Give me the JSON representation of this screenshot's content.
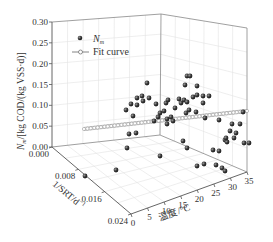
{
  "chart_data": {
    "type": "scatter3d",
    "title": "",
    "zlabel": "N_m/[kg COD/(kg VSS·d)]",
    "xlabel": "1/SRT/d⁻¹",
    "ylabel": "温度/°C",
    "zlim": [
      0,
      0.3
    ],
    "xlim": [
      0,
      0.024
    ],
    "ylim": [
      0,
      35
    ],
    "z_ticks": [
      "0.00",
      "0.05",
      "0.10",
      "0.15",
      "0.20",
      "0.25",
      "0.30"
    ],
    "x_ticks": [
      "0.000",
      "0.008",
      "0.016",
      "0.024"
    ],
    "y_ticks": [
      "0",
      "5",
      "10",
      "15",
      "20",
      "25",
      "30",
      "35"
    ],
    "grid": true,
    "legend": {
      "position": "upper-left",
      "entries": [
        {
          "label": "N",
          "subscript": "m",
          "marker": "sphere"
        },
        {
          "label": "Fit curve",
          "marker": "line-open-circle"
        }
      ]
    },
    "series": [
      {
        "name": "N_m",
        "note": "screen-projected positions (px) of observed points",
        "points_px": [
          [
            85,
            176
          ],
          [
            116,
            170
          ],
          [
            127,
            148
          ],
          [
            133,
            116
          ],
          [
            131,
            104
          ],
          [
            137,
            105
          ],
          [
            126,
            110
          ],
          [
            136,
            133
          ],
          [
            129,
            134
          ],
          [
            137,
            98
          ],
          [
            142,
            96
          ],
          [
            143,
            101
          ],
          [
            156,
            104
          ],
          [
            149,
            98
          ],
          [
            158,
            117
          ],
          [
            167,
            119
          ],
          [
            171,
            117
          ],
          [
            173,
            121
          ],
          [
            160,
            113
          ],
          [
            166,
            103
          ],
          [
            168,
            100
          ],
          [
            175,
            108
          ],
          [
            179,
            99
          ],
          [
            181,
            103
          ],
          [
            184,
            100
          ],
          [
            187,
            102
          ],
          [
            189,
            110
          ],
          [
            196,
            112
          ],
          [
            193,
            97
          ],
          [
            203,
            103
          ],
          [
            205,
            118
          ],
          [
            183,
            141
          ],
          [
            160,
            156
          ],
          [
            187,
            148
          ],
          [
            197,
            166
          ],
          [
            204,
            164
          ],
          [
            219,
            151
          ],
          [
            213,
            150
          ],
          [
            216,
            165
          ],
          [
            225,
            140
          ],
          [
            227,
            142
          ],
          [
            219,
            120
          ],
          [
            230,
            131
          ],
          [
            232,
            124
          ],
          [
            226,
            138
          ],
          [
            234,
            138
          ],
          [
            222,
            168
          ],
          [
            225,
            171
          ],
          [
            236,
            133
          ],
          [
            243,
            112
          ],
          [
            240,
            124
          ],
          [
            244,
            143
          ],
          [
            249,
            143
          ],
          [
            187,
            76
          ],
          [
            190,
            76
          ],
          [
            185,
            85
          ],
          [
            197,
            86
          ],
          [
            197,
            95
          ],
          [
            203,
            96
          ],
          [
            209,
            96
          ],
          [
            147,
            83
          ],
          [
            164,
            111
          ],
          [
            186,
            113
          ],
          [
            167,
            124
          ],
          [
            154,
            121
          ]
        ],
        "color": "#2b2b2b"
      },
      {
        "name": "Fit curve",
        "line_px": [
          [
            84,
            129
          ],
          [
            247,
            111
          ]
        ],
        "color": "#9a9a9a"
      }
    ]
  }
}
